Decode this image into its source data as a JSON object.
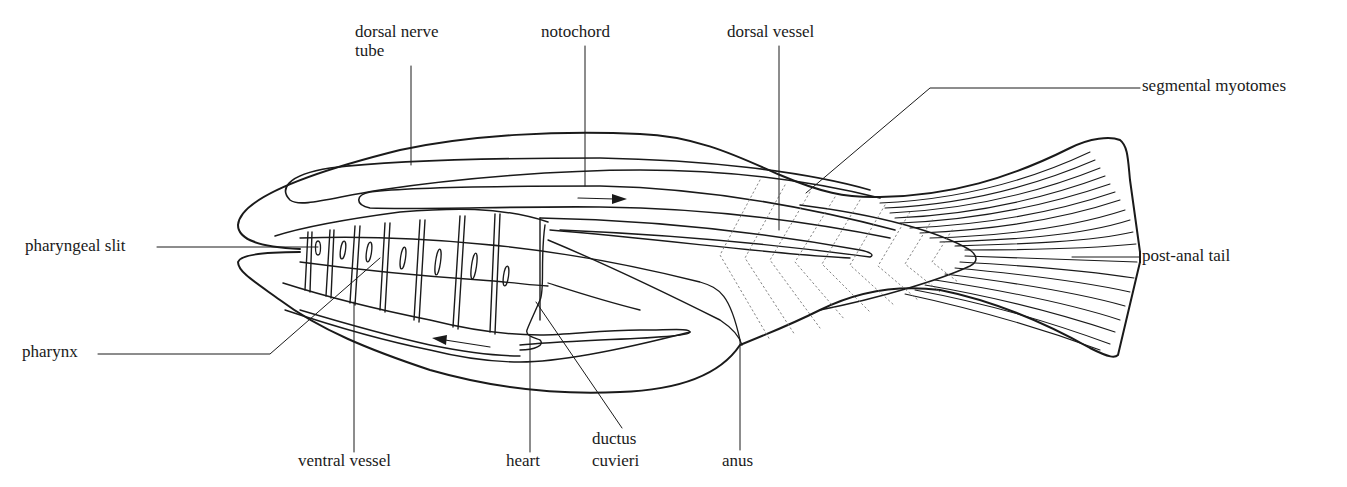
{
  "diagram": {
    "colors": {
      "ink": "#1a1a1a",
      "background": "#ffffff",
      "myotome_dots": "#777777"
    },
    "labels": {
      "dorsal_nerve_tube_line1": "dorsal nerve",
      "dorsal_nerve_tube_line2": "tube",
      "notochord": "notochord",
      "dorsal_vessel": "dorsal vessel",
      "segmental_myotomes": "segmental myotomes",
      "pharyngeal_slit": "pharyngeal slit",
      "pharynx": "pharynx",
      "post_anal_tail": "post-anal tail",
      "ventral_vessel": "ventral vessel",
      "heart": "heart",
      "ductus_cuvieri_line1": "ductus",
      "ductus_cuvieri_line2": "cuvieri",
      "anus": "anus"
    },
    "arrows": [
      {
        "name": "dorsal-flow-arrow",
        "direction": "posterior"
      },
      {
        "name": "ventral-flow-arrow",
        "direction": "anterior"
      }
    ]
  }
}
